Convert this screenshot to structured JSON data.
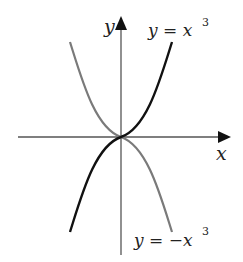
{
  "diagram": {
    "axes": {
      "x_label": "x",
      "y_label": "y",
      "axis_color": "#555555"
    },
    "curves": [
      {
        "name": "cube",
        "label_base": "y = x",
        "label_exp": "3",
        "color": "#111111"
      },
      {
        "name": "neg-cube",
        "label_base": "y = −x",
        "label_exp": "3",
        "color": "#7a7a7a"
      }
    ]
  }
}
